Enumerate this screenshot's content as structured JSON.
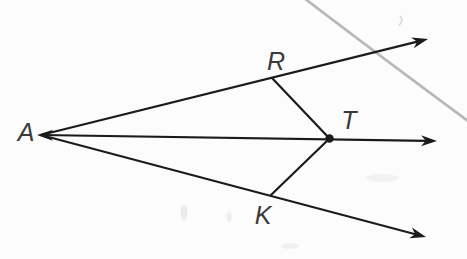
{
  "figure": {
    "colors": {
      "background": "#fcfcfc",
      "ink": "#1b1b1b",
      "label": "#3a3a3a",
      "stray": "#ababab",
      "smudge": "#d9d9d9"
    },
    "stroke_width": 2.2,
    "points": {
      "A": {
        "label": "A",
        "x": 41,
        "y": 135,
        "label_x": 26,
        "label_y": 132
      },
      "R": {
        "label": "R",
        "x": 272,
        "y": 78,
        "label_x": 276,
        "label_y": 61
      },
      "T": {
        "label": "T",
        "x": 329.5,
        "y": 138.5,
        "label_x": 349,
        "label_y": 120,
        "dot_radius": 4.2
      },
      "K": {
        "label": "K",
        "x": 271,
        "y": 195,
        "label_x": 263,
        "label_y": 215
      }
    },
    "rays": [
      {
        "name": "ray-A-through-R",
        "from": "A",
        "through": "R",
        "tip_x": 428,
        "tip_y": 39
      },
      {
        "name": "ray-A-through-T",
        "from": "A",
        "through": "T",
        "tip_x": 437,
        "tip_y": 141
      },
      {
        "name": "ray-A-through-K",
        "from": "A",
        "through": "K",
        "tip_x": 426,
        "tip_y": 237
      }
    ],
    "left_arrow": {
      "tip_x": 37,
      "tip_y": 135
    },
    "segments": [
      {
        "name": "segment-R-T",
        "from": "R",
        "to": "T"
      },
      {
        "name": "segment-K-T",
        "from": "K",
        "to": "T"
      }
    ],
    "stray_line": {
      "x1": 304,
      "y1": -2,
      "cx": 372,
      "cy": 50,
      "x2": 468,
      "y2": 121,
      "width": 2.7
    },
    "artifacts": {
      "comma": {
        "d": "M 400 16 q 4 4.5 -1 9.5",
        "width": 1.6
      },
      "smudges": [
        {
          "cx": 184,
          "cy": 213,
          "rx": 3.5,
          "ry": 8,
          "opacity": 0.45
        },
        {
          "cx": 229,
          "cy": 217,
          "rx": 2.5,
          "ry": 5,
          "opacity": 0.4
        },
        {
          "cx": 290,
          "cy": 246,
          "rx": 9,
          "ry": 3,
          "opacity": 0.35
        },
        {
          "cx": 382,
          "cy": 178,
          "rx": 16,
          "ry": 4,
          "opacity": 0.3
        }
      ]
    }
  }
}
